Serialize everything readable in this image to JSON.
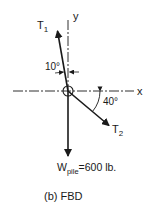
{
  "diagram": {
    "caption": "(b) FBD",
    "axes": {
      "x_label": "x",
      "y_label": "y"
    },
    "forces": [
      {
        "name": "T",
        "subscript": "1",
        "angle_label": "10°",
        "angle_ref": "from y-axis"
      },
      {
        "name": "T",
        "subscript": "2",
        "angle_label": "40°",
        "angle_ref": "below x-axis"
      },
      {
        "name": "W",
        "subscript": "pile",
        "value_label": "=600 lb."
      }
    ],
    "colors": {
      "line": "#1a1a1a",
      "background": "#ffffff"
    }
  }
}
